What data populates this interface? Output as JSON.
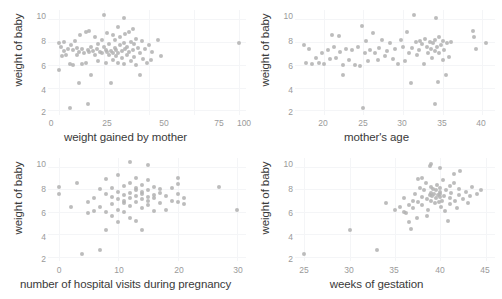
{
  "figure": {
    "type": "scatterplot-matrix",
    "panel_count": 4,
    "background": "#ffffff",
    "point_color": "#b0b0b0",
    "grid_color": "#f4f5f7",
    "axis_text_color": "#9a9a9a",
    "label_text_color": "#3a3a3a"
  },
  "chart_data": [
    {
      "type": "scatter",
      "title": "",
      "xlabel": "weight gained by mother",
      "ylabel": "weight of baby",
      "xticks": [
        0,
        25,
        50,
        75,
        100
      ],
      "yticks": [
        2,
        4,
        6,
        8,
        10
      ],
      "xlim": [
        -6,
        104
      ],
      "ylim": [
        1.6,
        10.8
      ],
      "grid": true,
      "legend": "none",
      "points": [
        [
          0,
          7.9
        ],
        [
          0,
          5.5
        ],
        [
          1,
          7.6
        ],
        [
          2,
          6.8
        ],
        [
          3,
          7.2
        ],
        [
          3,
          8.0
        ],
        [
          4,
          6.9
        ],
        [
          5,
          7.4
        ],
        [
          6,
          2.2
        ],
        [
          6,
          6.1
        ],
        [
          7,
          7.7
        ],
        [
          8,
          6.0
        ],
        [
          8,
          7.3
        ],
        [
          9,
          8.1
        ],
        [
          10,
          6.9
        ],
        [
          10,
          7.5
        ],
        [
          11,
          4.4
        ],
        [
          11,
          7.1
        ],
        [
          12,
          8.6
        ],
        [
          13,
          6.1
        ],
        [
          13,
          7.4
        ],
        [
          14,
          7.0
        ],
        [
          15,
          8.9
        ],
        [
          15,
          6.2
        ],
        [
          16,
          7.3
        ],
        [
          16,
          2.6
        ],
        [
          17,
          9.0
        ],
        [
          17,
          7.1
        ],
        [
          18,
          5.1
        ],
        [
          18,
          7.6
        ],
        [
          19,
          7.2
        ],
        [
          20,
          8.4
        ],
        [
          20,
          6.9
        ],
        [
          21,
          7.4
        ],
        [
          22,
          7.8
        ],
        [
          22,
          6.3
        ],
        [
          23,
          7.1
        ],
        [
          24,
          8.2
        ],
        [
          24,
          7.0
        ],
        [
          25,
          10.4
        ],
        [
          25,
          7.6
        ],
        [
          26,
          6.2
        ],
        [
          26,
          7.3
        ],
        [
          27,
          8.8
        ],
        [
          27,
          7.1
        ],
        [
          28,
          6.9
        ],
        [
          28,
          7.8
        ],
        [
          29,
          4.4
        ],
        [
          29,
          7.2
        ],
        [
          30,
          8.6
        ],
        [
          30,
          7.0
        ],
        [
          30,
          6.4
        ],
        [
          31,
          7.5
        ],
        [
          31,
          8.2
        ],
        [
          32,
          6.8
        ],
        [
          32,
          7.3
        ],
        [
          33,
          9.3
        ],
        [
          33,
          7.0
        ],
        [
          33,
          6.2
        ],
        [
          34,
          7.7
        ],
        [
          34,
          8.4
        ],
        [
          35,
          6.6
        ],
        [
          35,
          7.2
        ],
        [
          36,
          10.1
        ],
        [
          36,
          7.9
        ],
        [
          36,
          6.1
        ],
        [
          37,
          7.4
        ],
        [
          37,
          8.7
        ],
        [
          38,
          6.9
        ],
        [
          38,
          7.6
        ],
        [
          39,
          8.9
        ],
        [
          39,
          7.1
        ],
        [
          40,
          6.3
        ],
        [
          40,
          8.0
        ],
        [
          41,
          9.1
        ],
        [
          41,
          7.3
        ],
        [
          42,
          6.7
        ],
        [
          42,
          7.8
        ],
        [
          43,
          8.3
        ],
        [
          43,
          6.0
        ],
        [
          44,
          7.5
        ],
        [
          45,
          5.1
        ],
        [
          45,
          7.0
        ],
        [
          46,
          8.1
        ],
        [
          47,
          6.5
        ],
        [
          48,
          7.4
        ],
        [
          49,
          6.2
        ],
        [
          50,
          7.7
        ],
        [
          51,
          6.4
        ],
        [
          52,
          7.1
        ],
        [
          55,
          8.2
        ],
        [
          57,
          6.8
        ],
        [
          100,
          7.9
        ]
      ]
    },
    {
      "type": "scatter",
      "title": "",
      "xlabel": "mother's age",
      "ylabel": "weight of baby",
      "xticks": [
        20,
        25,
        30,
        35,
        40
      ],
      "yticks": [
        2,
        4,
        6,
        8,
        10
      ],
      "xlim": [
        16.4,
        41.6
      ],
      "ylim": [
        1.6,
        10.8
      ],
      "grid": true,
      "legend": "none",
      "points": [
        [
          17.5,
          7.7
        ],
        [
          17.8,
          6.2
        ],
        [
          18.2,
          7.4
        ],
        [
          18.6,
          6.1
        ],
        [
          19.0,
          6.6
        ],
        [
          19.4,
          6.2
        ],
        [
          19.8,
          7.0
        ],
        [
          20.1,
          6.1
        ],
        [
          20.5,
          7.3
        ],
        [
          20.8,
          6.5
        ],
        [
          21.0,
          8.6
        ],
        [
          21.3,
          7.6
        ],
        [
          21.6,
          6.6
        ],
        [
          21.9,
          8.5
        ],
        [
          22.1,
          7.1
        ],
        [
          22.4,
          6.0
        ],
        [
          22.5,
          5.1
        ],
        [
          22.8,
          7.4
        ],
        [
          23.2,
          6.4
        ],
        [
          23.6,
          7.3
        ],
        [
          24.0,
          6.0
        ],
        [
          24.3,
          7.6
        ],
        [
          24.6,
          5.9
        ],
        [
          24.8,
          9.4
        ],
        [
          25.0,
          2.2
        ],
        [
          25.2,
          7.0
        ],
        [
          25.4,
          8.1
        ],
        [
          25.6,
          6.3
        ],
        [
          25.9,
          7.3
        ],
        [
          26.2,
          8.8
        ],
        [
          26.5,
          7.0
        ],
        [
          26.8,
          6.4
        ],
        [
          27.0,
          7.5
        ],
        [
          27.4,
          8.2
        ],
        [
          27.8,
          6.8
        ],
        [
          28.0,
          7.2
        ],
        [
          28.4,
          7.9
        ],
        [
          28.8,
          6.5
        ],
        [
          29.0,
          7.4
        ],
        [
          29.4,
          6.1
        ],
        [
          29.8,
          8.2
        ],
        [
          30.0,
          7.6
        ],
        [
          30.2,
          6.3
        ],
        [
          30.5,
          8.9
        ],
        [
          30.8,
          7.0
        ],
        [
          31.0,
          4.4
        ],
        [
          31.2,
          7.5
        ],
        [
          31.4,
          10.4
        ],
        [
          31.6,
          8.0
        ],
        [
          31.8,
          6.9
        ],
        [
          32.0,
          7.3
        ],
        [
          32.2,
          8.1
        ],
        [
          32.4,
          7.8
        ],
        [
          32.6,
          6.1
        ],
        [
          32.8,
          8.3
        ],
        [
          33.0,
          7.6
        ],
        [
          33.2,
          7.0
        ],
        [
          33.4,
          8.0
        ],
        [
          33.5,
          7.4
        ],
        [
          33.6,
          6.6
        ],
        [
          33.8,
          7.9
        ],
        [
          34.0,
          2.6
        ],
        [
          34.0,
          8.2
        ],
        [
          34.1,
          7.2
        ],
        [
          34.2,
          10.1
        ],
        [
          34.3,
          7.6
        ],
        [
          34.4,
          4.5
        ],
        [
          34.5,
          8.4
        ],
        [
          34.6,
          7.0
        ],
        [
          34.8,
          7.7
        ],
        [
          35.0,
          6.4
        ],
        [
          35.1,
          8.1
        ],
        [
          35.2,
          7.3
        ],
        [
          35.4,
          5.1
        ],
        [
          35.6,
          7.9
        ],
        [
          35.8,
          6.7
        ],
        [
          36.0,
          8.0
        ],
        [
          38.8,
          9.0
        ],
        [
          39.0,
          8.4
        ],
        [
          39.2,
          7.4
        ],
        [
          40.5,
          7.9
        ]
      ]
    },
    {
      "type": "scatter",
      "title": "",
      "xlabel": "number of hospital visits during pregnancy",
      "ylabel": "weight of baby",
      "xticks": [
        0,
        10,
        20,
        30
      ],
      "yticks": [
        2,
        4,
        6,
        8,
        10
      ],
      "xlim": [
        -1.8,
        31.5
      ],
      "ylim": [
        1.6,
        10.8
      ],
      "grid": true,
      "legend": "none",
      "points": [
        [
          0,
          8.2
        ],
        [
          0,
          7.6
        ],
        [
          2,
          6.4
        ],
        [
          3,
          8.6
        ],
        [
          4,
          2.2
        ],
        [
          5,
          6.9
        ],
        [
          5,
          5.9
        ],
        [
          6,
          7.2
        ],
        [
          6,
          6.1
        ],
        [
          7,
          8.0
        ],
        [
          7,
          2.6
        ],
        [
          7,
          6.4
        ],
        [
          8,
          7.6
        ],
        [
          8,
          6.0
        ],
        [
          8,
          8.9
        ],
        [
          8,
          4.4
        ],
        [
          9,
          7.3
        ],
        [
          9,
          6.7
        ],
        [
          9,
          8.1
        ],
        [
          9,
          5.6
        ],
        [
          10,
          7.8
        ],
        [
          10,
          7.1
        ],
        [
          10,
          6.2
        ],
        [
          10,
          9.3
        ],
        [
          10,
          5.1
        ],
        [
          11,
          7.5
        ],
        [
          11,
          8.3
        ],
        [
          11,
          6.8
        ],
        [
          11,
          7.0
        ],
        [
          11,
          6.0
        ],
        [
          12,
          7.7
        ],
        [
          12,
          8.6
        ],
        [
          12,
          7.2
        ],
        [
          12,
          6.5
        ],
        [
          12,
          10.4
        ],
        [
          12,
          5.4
        ],
        [
          13,
          7.9
        ],
        [
          13,
          7.4
        ],
        [
          13,
          8.1
        ],
        [
          13,
          6.9
        ],
        [
          13,
          9.0
        ],
        [
          13,
          5.2
        ],
        [
          14,
          7.6
        ],
        [
          14,
          8.4
        ],
        [
          14,
          7.1
        ],
        [
          14,
          6.3
        ],
        [
          14,
          7.8
        ],
        [
          14,
          4.4
        ],
        [
          15,
          7.3
        ],
        [
          15,
          8.8
        ],
        [
          15,
          7.0
        ],
        [
          15,
          6.6
        ],
        [
          15,
          10.2
        ],
        [
          15,
          7.9
        ],
        [
          16,
          7.5
        ],
        [
          16,
          6.1
        ],
        [
          16,
          8.2
        ],
        [
          16,
          7.2
        ],
        [
          17,
          7.7
        ],
        [
          17,
          6.8
        ],
        [
          17,
          8.0
        ],
        [
          18,
          7.4
        ],
        [
          18,
          6.2
        ],
        [
          19,
          8.1
        ],
        [
          19,
          7.0
        ],
        [
          20,
          9.0
        ],
        [
          20,
          7.6
        ],
        [
          20,
          6.9
        ],
        [
          20,
          8.5
        ],
        [
          21,
          7.2
        ],
        [
          21,
          6.7
        ],
        [
          27,
          8.2
        ],
        [
          30,
          6.2
        ]
      ]
    },
    {
      "type": "scatter",
      "title": "",
      "xlabel": "weeks of gestation",
      "ylabel": "weight of baby",
      "xticks": [
        25,
        30,
        35,
        40,
        45
      ],
      "yticks": [
        2,
        4,
        6,
        8,
        10
      ],
      "xlim": [
        24.0,
        46.0
      ],
      "ylim": [
        1.6,
        10.8
      ],
      "grid": true,
      "legend": "none",
      "points": [
        [
          25,
          2.2
        ],
        [
          30,
          4.4
        ],
        [
          33,
          2.6
        ],
        [
          34,
          6.8
        ],
        [
          35,
          6.2
        ],
        [
          35.5,
          6.4
        ],
        [
          36,
          6.0
        ],
        [
          36,
          7.2
        ],
        [
          36.2,
          5.9
        ],
        [
          36.5,
          6.6
        ],
        [
          36.8,
          4.5
        ],
        [
          37,
          7.0
        ],
        [
          37,
          6.3
        ],
        [
          37.2,
          7.6
        ],
        [
          37.4,
          5.4
        ],
        [
          37.5,
          6.9
        ],
        [
          37.8,
          8.1
        ],
        [
          38,
          7.3
        ],
        [
          38,
          6.6
        ],
        [
          38.2,
          7.9
        ],
        [
          38.4,
          8.6
        ],
        [
          38.5,
          7.1
        ],
        [
          38.6,
          6.2
        ],
        [
          38.8,
          7.5
        ],
        [
          39,
          7.7
        ],
        [
          39,
          8.2
        ],
        [
          39,
          7.0
        ],
        [
          39.1,
          7.4
        ],
        [
          39.2,
          8.0
        ],
        [
          39.3,
          7.6
        ],
        [
          39.4,
          6.8
        ],
        [
          39.5,
          7.9
        ],
        [
          39.5,
          7.2
        ],
        [
          39.6,
          8.4
        ],
        [
          39.7,
          7.5
        ],
        [
          39.8,
          6.9
        ],
        [
          39.9,
          7.8
        ],
        [
          40,
          7.3
        ],
        [
          40,
          8.1
        ],
        [
          40,
          7.6
        ],
        [
          40.1,
          6.4
        ],
        [
          40.2,
          7.0
        ],
        [
          40.3,
          8.8
        ],
        [
          40.4,
          7.4
        ],
        [
          40.5,
          6.1
        ],
        [
          40.6,
          7.9
        ],
        [
          40.8,
          5.2
        ],
        [
          41,
          7.2
        ],
        [
          41,
          8.3
        ],
        [
          41,
          6.7
        ],
        [
          41.2,
          7.7
        ],
        [
          41.5,
          9.4
        ],
        [
          41.6,
          7.0
        ],
        [
          41.8,
          6.3
        ],
        [
          42,
          8.0
        ],
        [
          42,
          7.5
        ],
        [
          42.2,
          9.6
        ],
        [
          42.5,
          7.1
        ],
        [
          42.8,
          7.8
        ],
        [
          43,
          6.8
        ],
        [
          43.2,
          7.4
        ],
        [
          43.5,
          8.2
        ],
        [
          44,
          7.6
        ],
        [
          44.5,
          7.9
        ],
        [
          39,
          10.3
        ],
        [
          38.8,
          10.1
        ],
        [
          40,
          9.9
        ],
        [
          38,
          9.0
        ],
        [
          37.5,
          8.9
        ],
        [
          41.5,
          8.6
        ],
        [
          36.5,
          5.1
        ],
        [
          38.5,
          5.6
        ]
      ]
    }
  ]
}
